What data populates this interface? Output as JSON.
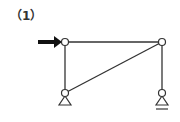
{
  "problem": {
    "label": "（1）"
  },
  "diagram": {
    "type": "truss-frame",
    "line_color": "#333333",
    "arrow_color": "#111111",
    "nodes": [
      {
        "id": "top-left",
        "x": 65,
        "y": 42
      },
      {
        "id": "top-right",
        "x": 162,
        "y": 42
      },
      {
        "id": "bottom-left",
        "x": 65,
        "y": 93
      },
      {
        "id": "bottom-right",
        "x": 162,
        "y": 93
      }
    ],
    "members": [
      {
        "from": "top-left",
        "to": "top-right"
      },
      {
        "from": "top-left",
        "to": "bottom-left"
      },
      {
        "from": "top-right",
        "to": "bottom-right"
      },
      {
        "from": "bottom-left",
        "to": "top-right"
      }
    ],
    "supports": [
      {
        "node": "bottom-left",
        "type": "pin"
      },
      {
        "node": "bottom-right",
        "type": "roller"
      }
    ],
    "loads": [
      {
        "node": "top-left",
        "direction": "right",
        "type": "horizontal-force-arrow"
      }
    ]
  }
}
